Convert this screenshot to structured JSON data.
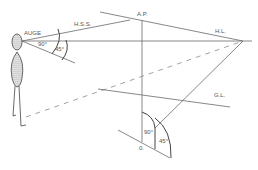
{
  "diagram": {
    "type": "perspective-construction",
    "labels": {
      "eye": "AUGE",
      "hss": "H.S.S.",
      "ap": "A.P.",
      "hl": "H.L.",
      "gl": "G.L.",
      "origin": "0.",
      "angle_90_top": "90°",
      "angle_45_top": "45°",
      "angle_90_bottom": "90°",
      "angle_45_bottom": "45°"
    },
    "colors": {
      "line": "#6a6a6a",
      "dashed": "#8a8a8a",
      "figure": "#444444",
      "text": "#555555"
    }
  }
}
